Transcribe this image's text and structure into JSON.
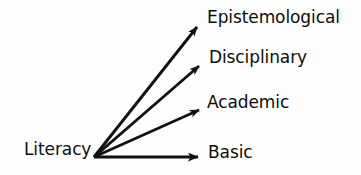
{
  "diagram": {
    "type": "radial-arrow-hierarchy",
    "background_color": "#fdfdfd",
    "stroke_color": "#111111",
    "text_color": "#0d0d0d",
    "source": {
      "label": "Literacy",
      "origin_x": 94,
      "origin_y": 157
    },
    "targets": [
      {
        "label": "Epistemological",
        "arrow_tip_x": 204,
        "arrow_tip_y": 21,
        "label_x": 207,
        "label_y": 8
      },
      {
        "label": "Disciplinary",
        "arrow_tip_x": 206,
        "arrow_tip_y": 61,
        "label_x": 209,
        "label_y": 48
      },
      {
        "label": "Academic",
        "arrow_tip_x": 206,
        "arrow_tip_y": 107,
        "label_x": 207,
        "label_y": 93
      },
      {
        "label": "Basic",
        "arrow_tip_x": 206,
        "arrow_tip_y": 157,
        "label_x": 208,
        "label_y": 143
      }
    ]
  }
}
